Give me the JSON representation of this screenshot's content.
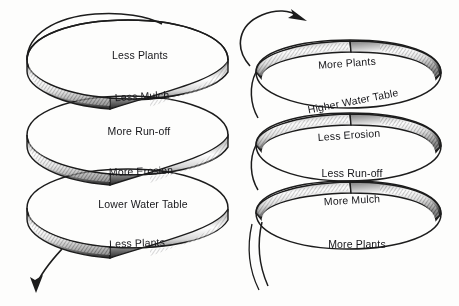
{
  "diagram": {
    "background_color": "#fdfdfc",
    "ink_color": "#16161a",
    "spirals": [
      {
        "id": "left-spiral",
        "name": "degradation-spiral",
        "direction": "downward",
        "arrow_position": "bottom-left",
        "arrow_icon": "arrow-down-left-icon",
        "labels": [
          {
            "text": "Less Plants",
            "x": 140,
            "y": 55,
            "rotation": 0
          },
          {
            "text": "Less Mulch",
            "x": 142,
            "y": 96,
            "rotation": -3
          },
          {
            "text": "More Run-off",
            "x": 139,
            "y": 131,
            "rotation": 0
          },
          {
            "text": "More Erosion",
            "x": 141,
            "y": 171,
            "rotation": -2
          },
          {
            "text": "Lower Water Table",
            "x": 143,
            "y": 204,
            "rotation": 0
          },
          {
            "text": "Less Plants",
            "x": 137,
            "y": 243,
            "rotation": -2
          }
        ]
      },
      {
        "id": "right-spiral",
        "name": "restoration-spiral",
        "direction": "upward",
        "arrow_position": "top-right",
        "arrow_icon": "arrow-up-right-icon",
        "labels": [
          {
            "text": "More Plants",
            "x": 347,
            "y": 63,
            "rotation": -4
          },
          {
            "text": "Higher Water Table",
            "x": 353,
            "y": 101,
            "rotation": -11
          },
          {
            "text": "Less Erosion",
            "x": 349,
            "y": 135,
            "rotation": -4
          },
          {
            "text": "Less Run-off",
            "x": 352,
            "y": 173,
            "rotation": 0
          },
          {
            "text": "More Mulch",
            "x": 352,
            "y": 200,
            "rotation": -3
          },
          {
            "text": "More Plants",
            "x": 357,
            "y": 244,
            "rotation": 0
          }
        ]
      }
    ]
  }
}
